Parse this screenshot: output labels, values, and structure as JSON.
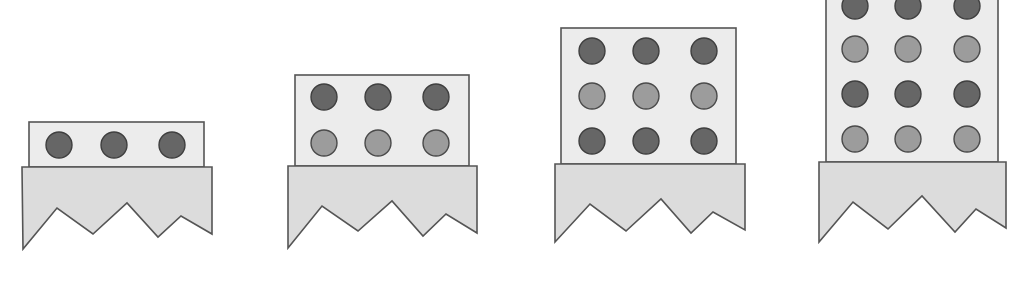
{
  "colors": {
    "background": "#ffffff",
    "block_fill": "#ececec",
    "base_fill": "#dcdcdc",
    "outline": "#555555",
    "dot_dark": "#666666",
    "dot_light": "#9c9c9c"
  },
  "figures": [
    {
      "name": "stage-1",
      "rows": 1,
      "columns": 3,
      "row_shades": [
        "dark"
      ],
      "block": {
        "x": 29,
        "y": 122,
        "w": 175,
        "h": 45
      },
      "base_points": "22,167 212,167 212,234 181,216 158,237 127,203 93,234 57,208 23,249",
      "dot_x": [
        59,
        114,
        172
      ],
      "dot_y": [
        145
      ]
    },
    {
      "name": "stage-2",
      "rows": 2,
      "columns": 3,
      "row_shades": [
        "dark",
        "light"
      ],
      "block": {
        "x": 295,
        "y": 75,
        "w": 174,
        "h": 91
      },
      "base_points": "288,166 477,166 477,233 446,214 423,236 392,201 358,231 322,206 288,248",
      "dot_x": [
        324,
        378,
        436
      ],
      "dot_y": [
        97,
        143
      ]
    },
    {
      "name": "stage-3",
      "rows": 3,
      "columns": 3,
      "row_shades": [
        "dark",
        "light",
        "dark"
      ],
      "block": {
        "x": 561,
        "y": 28,
        "w": 175,
        "h": 136
      },
      "base_points": "555,164 745,164 745,230 713,212 691,233 661,199 626,231 590,204 555,242",
      "dot_x": [
        592,
        646,
        704
      ],
      "dot_y": [
        51,
        96,
        141
      ]
    },
    {
      "name": "stage-4",
      "rows": 4,
      "columns": 3,
      "row_shades": [
        "dark",
        "light",
        "dark",
        "light"
      ],
      "block": {
        "x": 826,
        "y": -20,
        "w": 172,
        "h": 182
      },
      "base_points": "819,162 1006,162 1006,228 976,209 955,232 922,196 888,229 853,202 819,242",
      "dot_x": [
        855,
        908,
        967
      ],
      "dot_y": [
        6,
        49,
        94,
        139
      ]
    }
  ],
  "dot_radius": 13
}
